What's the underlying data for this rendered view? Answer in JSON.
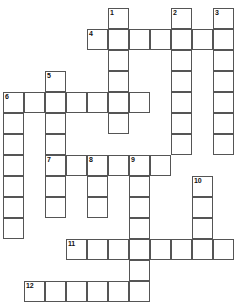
{
  "puzzle": {
    "kind": "crossword-grid",
    "width": 233,
    "height": 297,
    "cell_size": 21,
    "origin_x": 3,
    "origin_y": 8,
    "columns": 11,
    "rows": 14,
    "colors": {
      "background": "#ffffff",
      "cell_fill": "#ffffff",
      "cell_border": "#555555",
      "number_text": "#111111"
    },
    "numbers": [
      {
        "label": "1",
        "col": 5,
        "row": 0
      },
      {
        "label": "2",
        "col": 8,
        "row": 0
      },
      {
        "label": "3",
        "col": 10,
        "row": 0
      },
      {
        "label": "4",
        "col": 4,
        "row": 1
      },
      {
        "label": "5",
        "col": 2,
        "row": 3
      },
      {
        "label": "6",
        "col": 0,
        "row": 4
      },
      {
        "label": "7",
        "col": 2,
        "row": 7
      },
      {
        "label": "8",
        "col": 4,
        "row": 7
      },
      {
        "label": "9",
        "col": 6,
        "row": 7
      },
      {
        "label": "10",
        "col": 9,
        "row": 8
      },
      {
        "label": "11",
        "col": 3,
        "row": 11
      },
      {
        "label": "12",
        "col": 1,
        "row": 13
      }
    ],
    "cells": [
      {
        "col": 5,
        "row": 0
      },
      {
        "col": 8,
        "row": 0
      },
      {
        "col": 10,
        "row": 0
      },
      {
        "col": 4,
        "row": 1
      },
      {
        "col": 5,
        "row": 1
      },
      {
        "col": 6,
        "row": 1
      },
      {
        "col": 7,
        "row": 1
      },
      {
        "col": 8,
        "row": 1
      },
      {
        "col": 9,
        "row": 1
      },
      {
        "col": 10,
        "row": 1
      },
      {
        "col": 5,
        "row": 2
      },
      {
        "col": 8,
        "row": 2
      },
      {
        "col": 10,
        "row": 2
      },
      {
        "col": 2,
        "row": 3
      },
      {
        "col": 5,
        "row": 3
      },
      {
        "col": 8,
        "row": 3
      },
      {
        "col": 10,
        "row": 3
      },
      {
        "col": 0,
        "row": 4
      },
      {
        "col": 1,
        "row": 4
      },
      {
        "col": 2,
        "row": 4
      },
      {
        "col": 3,
        "row": 4
      },
      {
        "col": 4,
        "row": 4
      },
      {
        "col": 5,
        "row": 4
      },
      {
        "col": 6,
        "row": 4
      },
      {
        "col": 8,
        "row": 4
      },
      {
        "col": 10,
        "row": 4
      },
      {
        "col": 0,
        "row": 5
      },
      {
        "col": 2,
        "row": 5
      },
      {
        "col": 5,
        "row": 5
      },
      {
        "col": 8,
        "row": 5
      },
      {
        "col": 10,
        "row": 5
      },
      {
        "col": 0,
        "row": 6
      },
      {
        "col": 2,
        "row": 6
      },
      {
        "col": 8,
        "row": 6
      },
      {
        "col": 10,
        "row": 6
      },
      {
        "col": 2,
        "row": 7
      },
      {
        "col": 3,
        "row": 7
      },
      {
        "col": 4,
        "row": 7
      },
      {
        "col": 5,
        "row": 7
      },
      {
        "col": 6,
        "row": 7
      },
      {
        "col": 7,
        "row": 7
      },
      {
        "col": 0,
        "row": 7
      },
      {
        "col": 0,
        "row": 8
      },
      {
        "col": 2,
        "row": 8
      },
      {
        "col": 4,
        "row": 8
      },
      {
        "col": 6,
        "row": 8
      },
      {
        "col": 9,
        "row": 8
      },
      {
        "col": 0,
        "row": 9
      },
      {
        "col": 2,
        "row": 9
      },
      {
        "col": 4,
        "row": 9
      },
      {
        "col": 6,
        "row": 9
      },
      {
        "col": 9,
        "row": 9
      },
      {
        "col": 0,
        "row": 10
      },
      {
        "col": 6,
        "row": 10
      },
      {
        "col": 9,
        "row": 10
      },
      {
        "col": 3,
        "row": 11
      },
      {
        "col": 4,
        "row": 11
      },
      {
        "col": 5,
        "row": 11
      },
      {
        "col": 6,
        "row": 11
      },
      {
        "col": 7,
        "row": 11
      },
      {
        "col": 8,
        "row": 11
      },
      {
        "col": 9,
        "row": 11
      },
      {
        "col": 10,
        "row": 11
      },
      {
        "col": 6,
        "row": 12
      },
      {
        "col": 1,
        "row": 13
      },
      {
        "col": 2,
        "row": 13
      },
      {
        "col": 3,
        "row": 13
      },
      {
        "col": 4,
        "row": 13
      },
      {
        "col": 5,
        "row": 13
      },
      {
        "col": 6,
        "row": 13
      }
    ]
  }
}
